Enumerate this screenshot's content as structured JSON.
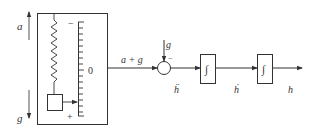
{
  "diagram": {
    "colors": {
      "stroke": "#333333",
      "background": "#ffffff"
    },
    "left_arrows": {
      "up_label": "a",
      "down_label": "g"
    },
    "accelerometer": {
      "scale_top_sign": "−",
      "scale_mid_label": "0",
      "scale_bottom_sign": "+",
      "tick_count": 17
    },
    "signals": {
      "sensor_output": "a + g",
      "gravity_input": "g",
      "sum_sign": "−",
      "h_ddot": "ḧ",
      "h_dot": "ḣ",
      "h": "h"
    },
    "blocks": [
      {
        "id": "integrator-1",
        "symbol": "∫"
      },
      {
        "id": "integrator-2",
        "symbol": "∫"
      }
    ]
  }
}
